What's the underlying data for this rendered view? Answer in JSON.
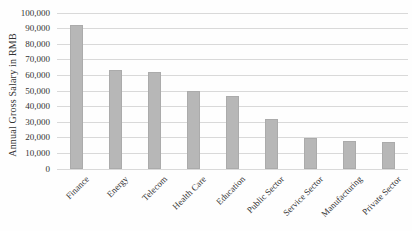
{
  "chart_data": {
    "type": "bar",
    "title": "",
    "xlabel": "",
    "ylabel": "Annual Gross Salary in RMB",
    "categories": [
      "Finance",
      "Energy",
      "Telecom",
      "Health Care",
      "Education",
      "Public Sector",
      "Service Sector",
      "Manufacturing",
      "Private Sector"
    ],
    "values": [
      92000,
      63500,
      62000,
      50000,
      47000,
      32000,
      20000,
      18000,
      17000
    ],
    "ylim": [
      0,
      100000
    ],
    "ytick_step": 10000,
    "ytick_labels": [
      "0",
      "10,000",
      "20,000",
      "30,000",
      "40,000",
      "50,000",
      "60,000",
      "70,000",
      "80,000",
      "90,000",
      "100,000"
    ],
    "grid": "horizontal",
    "legend": "none",
    "x_label_rotation_deg": -45,
    "colors": {
      "bar_fill": "#b7b7b7",
      "bar_edge": "#a5a5a5",
      "gridline": "#d9d9d9",
      "axis_text": "#333333",
      "background": "#fefefe"
    }
  }
}
